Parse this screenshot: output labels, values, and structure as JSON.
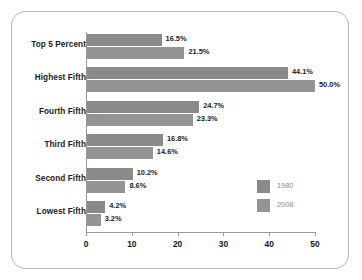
{
  "chart_data": {
    "type": "bar",
    "orientation": "horizontal",
    "title": "",
    "xlabel": "",
    "ylabel": "",
    "xlim": [
      0,
      50
    ],
    "xticks": [
      0,
      10,
      20,
      30,
      40,
      50
    ],
    "xtick_labels": [
      "0",
      "10",
      "20",
      "30",
      "40",
      "50"
    ],
    "grid": false,
    "legend_position": "inside-right",
    "value_suffix": "%",
    "categories": [
      "Top 5 Percent",
      "Highest Fifth",
      "Fourth Fifth",
      "Third Fifth",
      "Second Fifth",
      "Lowest Fifth"
    ],
    "series": [
      {
        "name": "1980",
        "color": "#8a8a8a",
        "values": [
          16.5,
          44.1,
          24.7,
          16.8,
          10.2,
          4.2
        ],
        "labels": [
          "16.5%",
          "44.1%",
          "24.7%",
          "16.8%",
          "10.2%",
          "4.2%"
        ]
      },
      {
        "name": "2008",
        "color": "#949494",
        "values": [
          21.5,
          50.0,
          23.3,
          14.6,
          8.6,
          3.2
        ],
        "labels": [
          "21.5%",
          "50.0%",
          "23.3%",
          "14.6%",
          "8.6%",
          "3.2%"
        ]
      }
    ]
  },
  "legend": {
    "entries": [
      {
        "label": "1980",
        "color": "#8a8a8a"
      },
      {
        "label": "2008",
        "color": "#949494"
      }
    ]
  },
  "colors": {
    "series_1980": "#8a8a8a",
    "series_2008": "#949494",
    "axis": "#9a9a9a",
    "frame_border": "#b9b9b9",
    "label_text": "#1b1b1b",
    "legend_text": "#8e8e8e",
    "background": "#ffffff"
  }
}
